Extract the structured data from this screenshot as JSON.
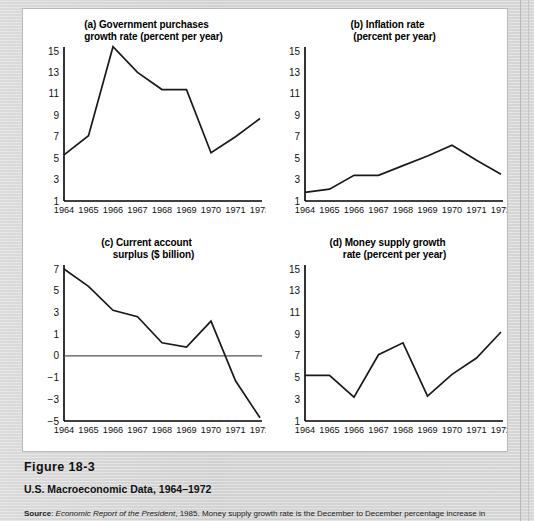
{
  "figure": {
    "number_label": "Figure 18-3",
    "title": "U.S. Macroeconomic Data, 1964–1972",
    "source_prefix": "Source",
    "source_italic": "Economic Report of the President",
    "source_rest": ", 1985. Money supply growth rate is the December to December percentage increase in"
  },
  "years": [
    "1964",
    "1965",
    "1966",
    "1967",
    "1968",
    "1969",
    "1970",
    "1971",
    "1972"
  ],
  "chart_data": [
    {
      "id": "a",
      "type": "line",
      "title_line1": "(a) Government purchases",
      "title_line2": "growth rate (percent per year)",
      "xlabel": "",
      "ylabel": "",
      "categories": [
        "1964",
        "1965",
        "1966",
        "1967",
        "1968",
        "1969",
        "1970",
        "1971",
        "1972"
      ],
      "values": [
        5.3,
        7.1,
        15.4,
        13.0,
        11.4,
        11.4,
        5.5,
        7.0,
        8.7
      ],
      "yticks": [
        1,
        3,
        5,
        7,
        9,
        11,
        13,
        15
      ],
      "ytick_labels": [
        "1",
        "3",
        "5",
        "7",
        "9",
        "11",
        "13",
        "15"
      ],
      "ylim": [
        1,
        15
      ],
      "zero_line": false,
      "grid": false
    },
    {
      "id": "b",
      "type": "line",
      "title_line1": "(b) Inflation rate",
      "title_line2": "(percent per year)",
      "xlabel": "",
      "ylabel": "",
      "categories": [
        "1964",
        "1965",
        "1966",
        "1967",
        "1968",
        "1969",
        "1970",
        "1971",
        "1972"
      ],
      "values": [
        1.8,
        2.1,
        3.4,
        3.4,
        4.3,
        5.2,
        6.2,
        4.8,
        3.5
      ],
      "yticks": [
        1,
        3,
        5,
        7,
        9,
        11,
        13,
        15
      ],
      "ytick_labels": [
        "1",
        "3",
        "5",
        "7",
        "9",
        "11",
        "13",
        "15"
      ],
      "ylim": [
        1,
        15
      ],
      "zero_line": false,
      "grid": false
    },
    {
      "id": "c",
      "type": "line",
      "title_line1": "(c) Current account",
      "title_line2": "surplus ($ billion)",
      "xlabel": "",
      "ylabel": "",
      "categories": [
        "1964",
        "1965",
        "1966",
        "1967",
        "1968",
        "1969",
        "1970",
        "1971",
        "1972"
      ],
      "values": [
        7.0,
        5.4,
        3.2,
        2.6,
        0.6,
        0.4,
        2.2,
        -1.3,
        -4.7
      ],
      "yticks": [
        -5,
        -3,
        -1,
        0,
        1,
        3,
        5,
        7
      ],
      "ytick_labels": [
        "−5",
        "−3",
        "−1",
        "0",
        "1",
        "3",
        "5",
        "7"
      ],
      "ylim": [
        -5,
        7
      ],
      "zero_line": true,
      "grid": false
    },
    {
      "id": "d",
      "type": "line",
      "title_line1": "(d) Money supply growth",
      "title_line2": "rate (percent per year)",
      "xlabel": "",
      "ylabel": "",
      "categories": [
        "1964",
        "1965",
        "1966",
        "1967",
        "1968",
        "1969",
        "1970",
        "1971",
        "1972"
      ],
      "values": [
        5.2,
        5.2,
        3.2,
        7.1,
        8.2,
        3.3,
        5.3,
        6.8,
        9.2
      ],
      "yticks": [
        1,
        3,
        5,
        7,
        9,
        11,
        13,
        15
      ],
      "ytick_labels": [
        "1",
        "3",
        "5",
        "7",
        "9",
        "11",
        "13",
        "15"
      ],
      "ylim": [
        1,
        15
      ],
      "zero_line": false,
      "grid": false
    }
  ],
  "colors": {
    "page_background": "#d6d6d6",
    "panel_background": "#ffffff",
    "line": "#1a1a1a",
    "axis": "#000000",
    "zero_line": "#555555",
    "text": "#111111"
  }
}
